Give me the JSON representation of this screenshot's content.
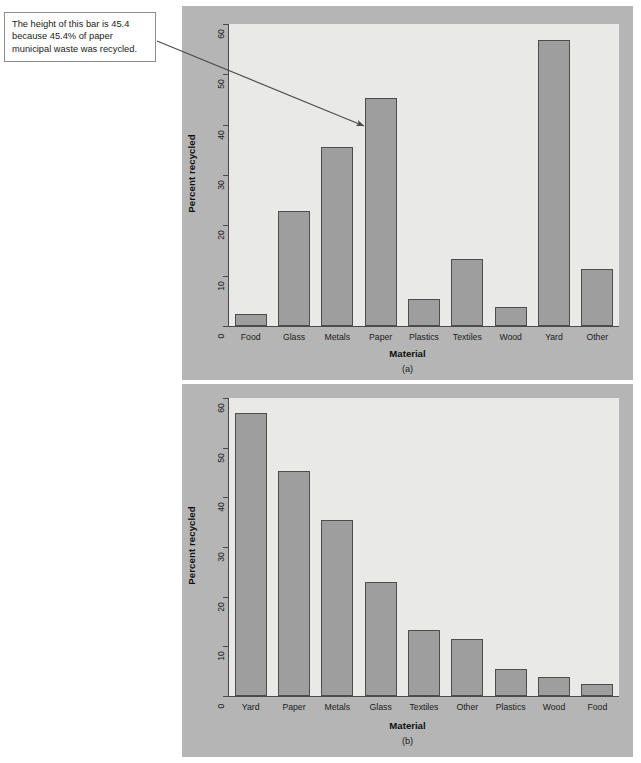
{
  "callout": {
    "text": "The height of this bar is 45.4 because 45.4% of paper municipal waste was recycled.",
    "annotation_icon": "arrow-icon"
  },
  "figure": {
    "panel_a_caption": "(a)",
    "panel_b_caption": "(b)"
  },
  "colors": {
    "page_background": "#ffffff",
    "panel_background": "#b5b5b5",
    "plot_background": "#e9e9e7",
    "bar_fill": "#9e9e9e",
    "bar_border": "#4d4d4d",
    "axis": "#4a4a4a",
    "text": "#1b1b1b"
  },
  "chart_data": [
    {
      "type": "bar",
      "title": "(a)",
      "xlabel": "Material",
      "ylabel": "Percent recycled",
      "ylim": [
        0,
        60
      ],
      "yticks": [
        0,
        10,
        20,
        30,
        40,
        50,
        60
      ],
      "grid": false,
      "legend": "none",
      "categories": [
        "Food",
        "Glass",
        "Metals",
        "Paper",
        "Plastics",
        "Textiles",
        "Wood",
        "Yard",
        "Other"
      ],
      "values": [
        2.4,
        22.9,
        35.5,
        45.4,
        5.4,
        13.3,
        3.8,
        56.9,
        11.4
      ],
      "annotation": {
        "target_category": "Paper",
        "target_value": 45.4,
        "text": "The height of this bar is 45.4 because 45.4% of paper municipal waste was recycled."
      }
    },
    {
      "type": "bar",
      "title": "(b)",
      "xlabel": "Material",
      "ylabel": "Percent recycled",
      "ylim": [
        0,
        60
      ],
      "yticks": [
        0,
        10,
        20,
        30,
        40,
        50,
        60
      ],
      "grid": false,
      "legend": "none",
      "sorted": "descending",
      "categories": [
        "Yard",
        "Paper",
        "Metals",
        "Glass",
        "Textiles",
        "Other",
        "Plastics",
        "Wood",
        "Food"
      ],
      "values": [
        56.9,
        45.4,
        35.5,
        22.9,
        13.3,
        11.4,
        5.4,
        3.8,
        2.4
      ]
    }
  ]
}
